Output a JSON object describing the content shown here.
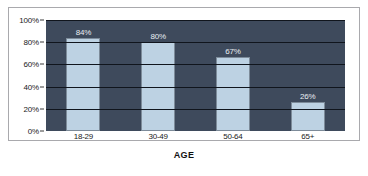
{
  "chart_data": {
    "type": "bar",
    "title": "",
    "subtitle": "",
    "xlabel": "AGE",
    "ylabel": "",
    "categories": [
      "18-29",
      "30-49",
      "50-64",
      "65+"
    ],
    "values": [
      84,
      80,
      67,
      26
    ],
    "value_labels": [
      "84%",
      "80%",
      "67%",
      "26%"
    ],
    "ylim": [
      0,
      100
    ],
    "yticks": [
      0,
      20,
      40,
      60,
      80,
      100
    ],
    "ytick_labels": [
      "0%",
      "20%",
      "40%",
      "60%",
      "80%",
      "100%"
    ],
    "grid": true,
    "legend": "none",
    "colors": {
      "bar_fill": "#bdd2e3",
      "bar_edge": "#7d8b99",
      "plot_background": "#3e4a5c",
      "gridline": "#10151d",
      "value_label_text": "#e8edf2",
      "axis_text": "#1a1a1a",
      "card_border": "#a9a9ad",
      "page_background": "#ffffff"
    }
  }
}
